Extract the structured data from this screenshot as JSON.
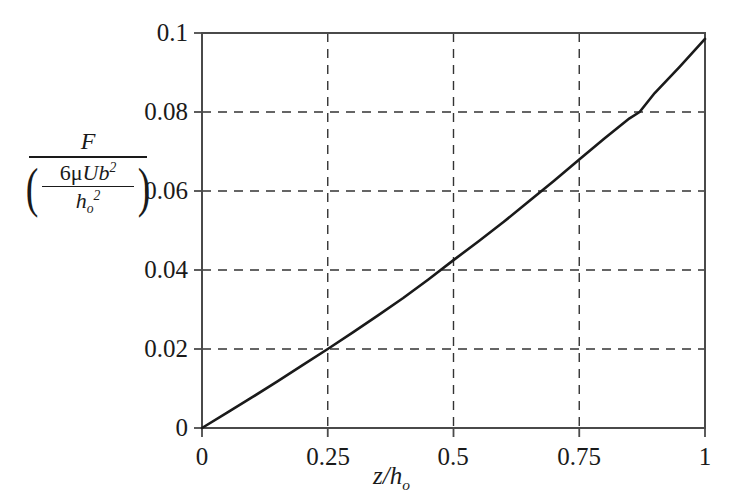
{
  "figure": {
    "background_color": "#ffffff",
    "axis_color": "#4a4a4a",
    "grid_color": "#333333",
    "curve_color": "#1a1a1a"
  },
  "axis_labels": {
    "y_numerator": "F",
    "y_denominator_numerator_prefix": "6",
    "y_denominator_numerator_mu": "μ",
    "y_denominator_numerator_U": "U",
    "y_denominator_numerator_b": "b",
    "y_denominator_numerator_b_exp": "2",
    "y_denominator_denominator_h": "h",
    "y_denominator_denominator_sub": "o",
    "y_denominator_denominator_exp": "2",
    "x_label_z": "z",
    "x_label_slash": "/",
    "x_label_h": "h",
    "x_label_h_sub": "o",
    "paren_open": "(",
    "paren_close": ")"
  },
  "chart_data": {
    "type": "line",
    "title": "",
    "subtitle": "",
    "xlabel": "z/h_o",
    "ylabel": "F / (6μUb^2 / h_o^2)",
    "xlim": [
      0,
      1
    ],
    "ylim": [
      0,
      0.1
    ],
    "grid": true,
    "grid_style": "dashed",
    "legend": "none",
    "xticks": [
      0,
      0.25,
      0.5,
      0.75,
      1
    ],
    "xtick_labels": [
      "0",
      "0.25",
      "0.5",
      "0.75",
      "1"
    ],
    "yticks": [
      0,
      0.02,
      0.04,
      0.06,
      0.08,
      0.1
    ],
    "ytick_labels": [
      "0",
      "0.02",
      "0.04",
      "0.06",
      "0.08",
      "0.1"
    ],
    "series": [
      {
        "name": "dimensionless friction force",
        "x": [
          0,
          0.05,
          0.1,
          0.15,
          0.2,
          0.25,
          0.3,
          0.35,
          0.4,
          0.45,
          0.5,
          0.55,
          0.6,
          0.65,
          0.7,
          0.75,
          0.8,
          0.85,
          0.87,
          0.9,
          0.95,
          1.0
        ],
        "y": [
          0.0,
          0.0039,
          0.0078,
          0.0118,
          0.0159,
          0.02,
          0.0242,
          0.0285,
          0.0329,
          0.0376,
          0.0425,
          0.0473,
          0.0522,
          0.0574,
          0.0626,
          0.068,
          0.0733,
          0.0784,
          0.08,
          0.0848,
          0.0915,
          0.0985
        ]
      }
    ]
  },
  "geometry": {
    "plot_left": 202,
    "plot_right": 705,
    "plot_top": 33,
    "plot_bottom": 428
  }
}
